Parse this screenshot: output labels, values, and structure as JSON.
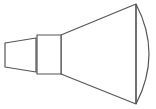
{
  "diagram": {
    "stroke_color": "#555555",
    "fill_color": "#ffffff",
    "parts": {
      "nozzle": {
        "points": "5,43 36,38 36,72 5,67"
      },
      "collar": {
        "x": 37,
        "y": 35,
        "width": 24,
        "height": 39
      },
      "cone": {
        "points": "61,35 136,4 136,104 61,74"
      },
      "bell_arc": {
        "d": "M136,4 Q162,54 136,104"
      },
      "bell_edge": {
        "x1": 136,
        "y1": 4,
        "x2": 136,
        "y2": 104
      }
    }
  }
}
